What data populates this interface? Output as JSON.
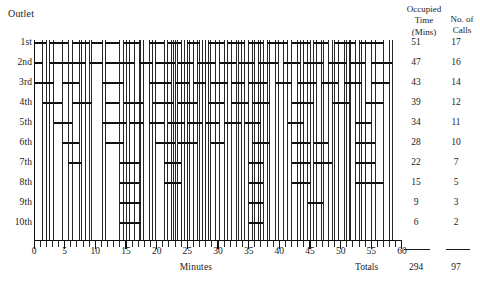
{
  "header": {
    "outlet_caption": "Outlet",
    "occupied_time_head": "Occupied\nTime\n(Mins)",
    "occupied_time_head_line1": "Occupied",
    "occupied_time_head_line2": "Time",
    "occupied_time_head_line3": "(Mins)",
    "calls_head_line1": "No. of",
    "calls_head_line2": "Calls"
  },
  "footer": {
    "totals_label": "Totals",
    "totals_minutes": "294",
    "totals_calls": "97"
  },
  "axis": {
    "title": "Minutes",
    "tick_labels": [
      "0",
      "5",
      "10",
      "15",
      "20",
      "25",
      "30",
      "35",
      "40",
      "45",
      "50",
      "55",
      "60"
    ]
  },
  "rows": [
    {
      "label": "1st",
      "occupied_minutes": "51",
      "calls": "17"
    },
    {
      "label": "2nd",
      "occupied_minutes": "47",
      "calls": "16"
    },
    {
      "label": "3rd",
      "occupied_minutes": "43",
      "calls": "14"
    },
    {
      "label": "4th",
      "occupied_minutes": "39",
      "calls": "12"
    },
    {
      "label": "5th",
      "occupied_minutes": "34",
      "calls": "11"
    },
    {
      "label": "6th",
      "occupied_minutes": "28",
      "calls": "10"
    },
    {
      "label": "7th",
      "occupied_minutes": "22",
      "calls": "7"
    },
    {
      "label": "8th",
      "occupied_minutes": "15",
      "calls": "5"
    },
    {
      "label": "9th",
      "occupied_minutes": "9",
      "calls": "3"
    },
    {
      "label": "10th",
      "occupied_minutes": "6",
      "calls": "2"
    }
  ],
  "chart_data": {
    "type": "bar",
    "xlabel": "Minutes",
    "ylabel": "Outlet",
    "xlim": [
      0,
      60
    ],
    "grid": false,
    "orientation": "horizontal",
    "note": "Gantt-style occupancy chart: each bar is one call held on a given outlet; vertical lines mark every call start/finish across the full chart height.",
    "categories": [
      "1st",
      "2nd",
      "3rd",
      "4th",
      "5th",
      "6th",
      "7th",
      "8th",
      "9th",
      "10th"
    ],
    "totals": {
      "occupied_minutes": 294,
      "calls": 97
    },
    "series": [
      {
        "name": "Occupied Time (Mins)",
        "values": [
          51,
          47,
          43,
          39,
          34,
          28,
          22,
          15,
          9,
          6
        ]
      },
      {
        "name": "No. of Calls",
        "values": [
          17,
          16,
          14,
          12,
          11,
          10,
          7,
          5,
          3,
          2
        ]
      }
    ],
    "bars": [
      {
        "row": 0,
        "start": 0.0,
        "end": 2.0
      },
      {
        "row": 0,
        "start": 2.6,
        "end": 5.6
      },
      {
        "row": 0,
        "start": 6.2,
        "end": 9.0
      },
      {
        "row": 0,
        "start": 9.4,
        "end": 11.2
      },
      {
        "row": 0,
        "start": 11.6,
        "end": 14.0
      },
      {
        "row": 0,
        "start": 14.6,
        "end": 17.2
      },
      {
        "row": 0,
        "start": 18.8,
        "end": 21.2
      },
      {
        "row": 0,
        "start": 21.8,
        "end": 24.0
      },
      {
        "row": 0,
        "start": 25.0,
        "end": 27.0
      },
      {
        "row": 0,
        "start": 28.4,
        "end": 31.0
      },
      {
        "row": 0,
        "start": 31.6,
        "end": 34.4
      },
      {
        "row": 0,
        "start": 35.0,
        "end": 37.4
      },
      {
        "row": 0,
        "start": 38.0,
        "end": 41.4
      },
      {
        "row": 0,
        "start": 42.0,
        "end": 45.0
      },
      {
        "row": 0,
        "start": 45.6,
        "end": 48.0
      },
      {
        "row": 0,
        "start": 49.0,
        "end": 52.4
      },
      {
        "row": 0,
        "start": 53.0,
        "end": 57.0
      },
      {
        "row": 1,
        "start": 0.0,
        "end": 1.4
      },
      {
        "row": 1,
        "start": 2.6,
        "end": 8.4
      },
      {
        "row": 1,
        "start": 9.0,
        "end": 11.2
      },
      {
        "row": 1,
        "start": 11.6,
        "end": 16.4
      },
      {
        "row": 1,
        "start": 17.2,
        "end": 19.4
      },
      {
        "row": 1,
        "start": 19.8,
        "end": 23.0
      },
      {
        "row": 1,
        "start": 23.4,
        "end": 26.0
      },
      {
        "row": 1,
        "start": 26.6,
        "end": 29.6
      },
      {
        "row": 1,
        "start": 30.2,
        "end": 33.0
      },
      {
        "row": 1,
        "start": 33.4,
        "end": 36.0
      },
      {
        "row": 1,
        "start": 36.6,
        "end": 39.8
      },
      {
        "row": 1,
        "start": 40.6,
        "end": 43.4
      },
      {
        "row": 1,
        "start": 44.0,
        "end": 47.2
      },
      {
        "row": 1,
        "start": 48.0,
        "end": 51.0
      },
      {
        "row": 1,
        "start": 51.6,
        "end": 54.0
      },
      {
        "row": 1,
        "start": 55.0,
        "end": 58.4
      },
      {
        "row": 2,
        "start": 0.0,
        "end": 3.2
      },
      {
        "row": 2,
        "start": 4.6,
        "end": 7.4
      },
      {
        "row": 2,
        "start": 11.2,
        "end": 14.6
      },
      {
        "row": 2,
        "start": 18.8,
        "end": 22.4
      },
      {
        "row": 2,
        "start": 23.0,
        "end": 25.4
      },
      {
        "row": 2,
        "start": 26.0,
        "end": 28.0
      },
      {
        "row": 2,
        "start": 28.8,
        "end": 31.6
      },
      {
        "row": 2,
        "start": 32.2,
        "end": 34.4
      },
      {
        "row": 2,
        "start": 35.0,
        "end": 38.0
      },
      {
        "row": 2,
        "start": 39.4,
        "end": 42.0
      },
      {
        "row": 2,
        "start": 43.0,
        "end": 46.0
      },
      {
        "row": 2,
        "start": 46.8,
        "end": 49.6
      },
      {
        "row": 2,
        "start": 50.6,
        "end": 53.4
      },
      {
        "row": 2,
        "start": 55.0,
        "end": 58.0
      },
      {
        "row": 3,
        "start": 1.4,
        "end": 4.6
      },
      {
        "row": 3,
        "start": 6.2,
        "end": 9.4
      },
      {
        "row": 3,
        "start": 11.6,
        "end": 14.0
      },
      {
        "row": 3,
        "start": 14.6,
        "end": 17.8
      },
      {
        "row": 3,
        "start": 19.4,
        "end": 22.8
      },
      {
        "row": 3,
        "start": 23.4,
        "end": 26.6
      },
      {
        "row": 3,
        "start": 28.4,
        "end": 31.0
      },
      {
        "row": 3,
        "start": 32.2,
        "end": 35.0
      },
      {
        "row": 3,
        "start": 35.6,
        "end": 38.4
      },
      {
        "row": 3,
        "start": 42.0,
        "end": 45.6
      },
      {
        "row": 3,
        "start": 48.6,
        "end": 51.4
      },
      {
        "row": 3,
        "start": 54.0,
        "end": 57.0
      },
      {
        "row": 4,
        "start": 3.2,
        "end": 6.2
      },
      {
        "row": 4,
        "start": 11.2,
        "end": 15.0
      },
      {
        "row": 4,
        "start": 15.6,
        "end": 17.8
      },
      {
        "row": 4,
        "start": 18.8,
        "end": 21.2
      },
      {
        "row": 4,
        "start": 21.8,
        "end": 24.6
      },
      {
        "row": 4,
        "start": 25.0,
        "end": 27.4
      },
      {
        "row": 4,
        "start": 28.0,
        "end": 30.2
      },
      {
        "row": 4,
        "start": 31.0,
        "end": 33.8
      },
      {
        "row": 4,
        "start": 34.4,
        "end": 37.0
      },
      {
        "row": 4,
        "start": 41.4,
        "end": 44.0
      },
      {
        "row": 4,
        "start": 52.4,
        "end": 55.0
      },
      {
        "row": 5,
        "start": 4.6,
        "end": 7.4
      },
      {
        "row": 5,
        "start": 11.6,
        "end": 14.6
      },
      {
        "row": 5,
        "start": 19.8,
        "end": 23.0
      },
      {
        "row": 5,
        "start": 23.4,
        "end": 26.6
      },
      {
        "row": 5,
        "start": 28.8,
        "end": 31.0
      },
      {
        "row": 5,
        "start": 35.6,
        "end": 38.4
      },
      {
        "row": 5,
        "start": 42.0,
        "end": 45.0
      },
      {
        "row": 5,
        "start": 45.6,
        "end": 48.0
      },
      {
        "row": 5,
        "start": 52.4,
        "end": 55.6
      },
      {
        "row": 6,
        "start": 5.6,
        "end": 7.8
      },
      {
        "row": 6,
        "start": 14.0,
        "end": 17.2
      },
      {
        "row": 6,
        "start": 21.2,
        "end": 24.0
      },
      {
        "row": 6,
        "start": 35.0,
        "end": 37.4
      },
      {
        "row": 6,
        "start": 42.0,
        "end": 45.0
      },
      {
        "row": 6,
        "start": 45.6,
        "end": 48.6
      },
      {
        "row": 6,
        "start": 52.4,
        "end": 55.6
      },
      {
        "row": 7,
        "start": 14.0,
        "end": 17.2
      },
      {
        "row": 7,
        "start": 21.2,
        "end": 24.0
      },
      {
        "row": 7,
        "start": 35.0,
        "end": 37.4
      },
      {
        "row": 7,
        "start": 42.0,
        "end": 45.0
      },
      {
        "row": 7,
        "start": 52.4,
        "end": 57.0
      },
      {
        "row": 8,
        "start": 14.0,
        "end": 17.4
      },
      {
        "row": 8,
        "start": 35.0,
        "end": 37.4
      },
      {
        "row": 8,
        "start": 44.6,
        "end": 47.2
      },
      {
        "row": 9,
        "start": 14.0,
        "end": 17.4
      },
      {
        "row": 9,
        "start": 35.0,
        "end": 37.4
      }
    ]
  }
}
